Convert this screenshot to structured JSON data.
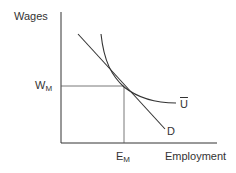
{
  "diagram": {
    "type": "labor-market-indifference",
    "y_axis_label": "Wages",
    "x_axis_label": "Employment",
    "wage_label": {
      "main": "W",
      "sub": "M"
    },
    "employment_label": {
      "main": "E",
      "sub": "M"
    },
    "curves": [
      {
        "name": "demand",
        "label": "D",
        "kind": "line"
      },
      {
        "name": "utility",
        "label": "U",
        "kind": "convex-curve",
        "overline": true
      }
    ],
    "tangent_point": {
      "label_x": "E_M",
      "label_y": "W_M"
    },
    "colors": {
      "line": "#333333",
      "guide": "#555555"
    }
  }
}
